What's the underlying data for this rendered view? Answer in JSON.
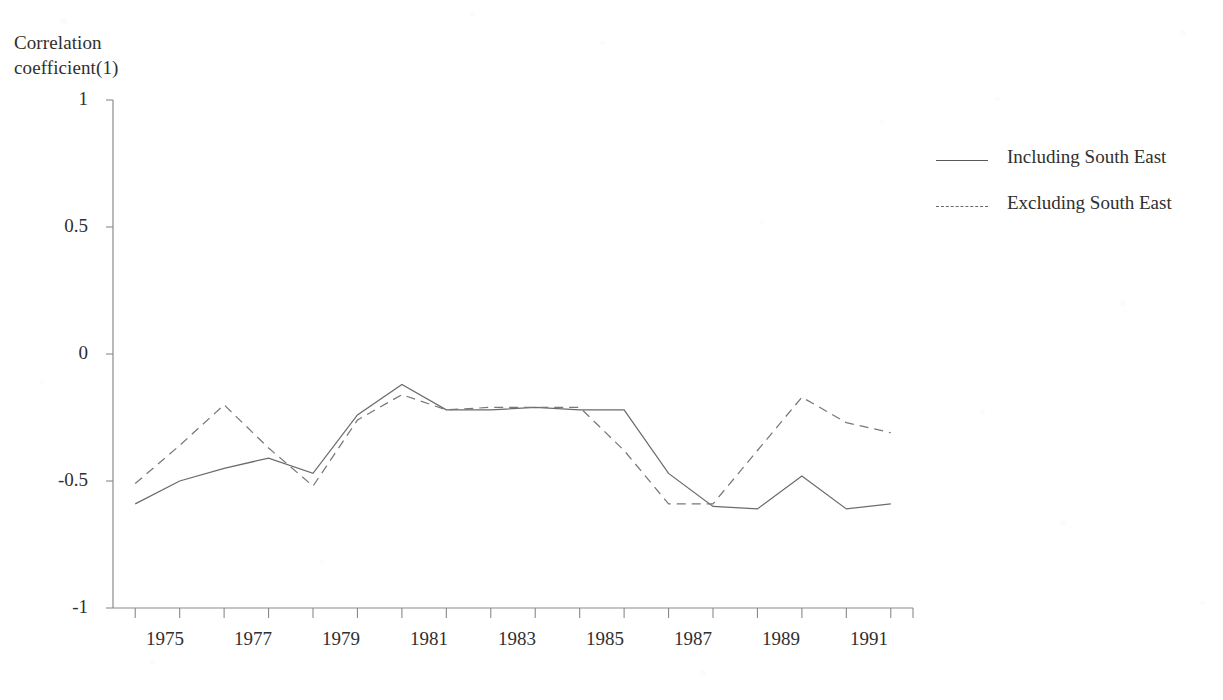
{
  "chart_data": {
    "type": "line",
    "title": "",
    "ylabel": "Correlation\ncoefficient(1)",
    "xlabel": "",
    "ylim": [
      -1,
      1
    ],
    "xlim": [
      1974.5,
      1992.5
    ],
    "ytick_labels": [
      "1",
      "0.5",
      "0",
      "-0.5",
      "-1"
    ],
    "ytick_values": [
      1,
      0.5,
      0,
      -0.5,
      -1
    ],
    "xtick_labels": [
      "1975",
      "1977",
      "1979",
      "1981",
      "1983",
      "1985",
      "1987",
      "1989",
      "1991"
    ],
    "xtick_values": [
      1975,
      1977,
      1979,
      1981,
      1983,
      1985,
      1987,
      1989,
      1991
    ],
    "grid": false,
    "legend_position": "right",
    "x": [
      1975,
      1976,
      1977,
      1978,
      1979,
      1980,
      1981,
      1982,
      1983,
      1984,
      1985,
      1986,
      1987,
      1988,
      1989,
      1990,
      1991,
      1992
    ],
    "series": [
      {
        "name": "Including South East",
        "style": "solid",
        "values": [
          -0.59,
          -0.5,
          -0.45,
          -0.41,
          -0.47,
          -0.24,
          -0.12,
          -0.22,
          -0.22,
          -0.21,
          -0.22,
          -0.22,
          -0.47,
          -0.6,
          -0.61,
          -0.48,
          -0.61,
          -0.59
        ]
      },
      {
        "name": "Excluding South East",
        "style": "dashed",
        "values": [
          -0.51,
          -0.36,
          -0.2,
          -0.37,
          -0.52,
          -0.26,
          -0.16,
          -0.22,
          -0.21,
          -0.21,
          -0.21,
          -0.38,
          -0.59,
          -0.59,
          -0.38,
          -0.17,
          -0.27,
          -0.31
        ]
      }
    ]
  },
  "legend": {
    "items": [
      {
        "label": "Including South East",
        "style": "solid"
      },
      {
        "label": "Excluding South East",
        "style": "dashed"
      }
    ]
  },
  "axes": {
    "y_title": "Correlation\ncoefficient(1)",
    "ytick_0": "1",
    "ytick_1": "0.5",
    "ytick_2": "0",
    "ytick_3": "-0.5",
    "ytick_4": "-1",
    "xtick_0": "1975",
    "xtick_1": "1977",
    "xtick_2": "1979",
    "xtick_3": "1981",
    "xtick_4": "1983",
    "xtick_5": "1985",
    "xtick_6": "1987",
    "xtick_7": "1989",
    "xtick_8": "1991"
  },
  "colors": {
    "solid_line": "#6b6b6b",
    "dashed_line": "#787878",
    "axis": "#8a8a8a",
    "text": "#2f2f2f",
    "background": "#ffffff"
  }
}
